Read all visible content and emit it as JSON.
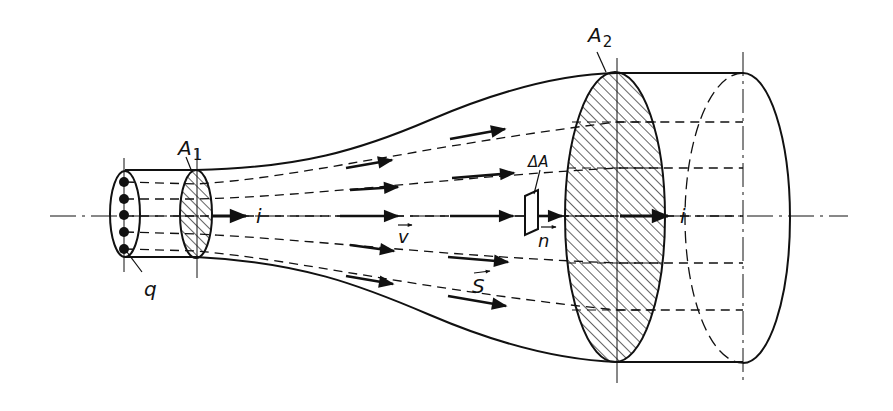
{
  "figure": {
    "labels": {
      "a1_main": "A",
      "a1_sub": "1",
      "a2_main": "A",
      "a2_sub": "2",
      "charge": "q",
      "current_left": "i",
      "current_right": "i",
      "velocity": "v",
      "current_density": "S",
      "area_element": "ΔA",
      "normal": "n"
    },
    "colors": {
      "ink": "#111111",
      "background": "#ffffff"
    },
    "charge_dots": 5,
    "streamlines": 5
  }
}
